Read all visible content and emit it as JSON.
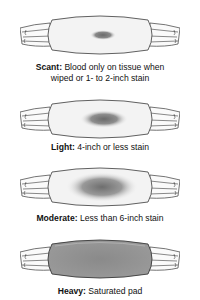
{
  "diagram": {
    "items": [
      {
        "level": "Scant:",
        "description": "Blood only on tissue when",
        "description2": "wiped or 1- to 2-inch stain",
        "stain": "tiny"
      },
      {
        "level": "Light:",
        "description": "4-inch or less stain",
        "stain": "small"
      },
      {
        "level": "Moderate:",
        "description": "Less than 6-inch stain",
        "stain": "medium"
      },
      {
        "level": "Heavy:",
        "description": "Saturated pad",
        "stain": "full"
      }
    ],
    "colors": {
      "outline": "#3a3a3a",
      "pad": "#f2f2f2",
      "stain": "#6e6e6e",
      "text": "#111111"
    }
  }
}
